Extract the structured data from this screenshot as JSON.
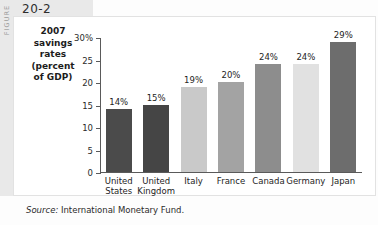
{
  "figure": {
    "label": "FIGURE",
    "number": "20-2"
  },
  "chart_data": {
    "type": "bar",
    "title": "",
    "ylabel": "2007 savings rates (percent of GDP)",
    "ylabel_lines": [
      "2007",
      "savings",
      "rates",
      "(percent",
      "of GDP)"
    ],
    "xlabel": "",
    "categories": [
      "United States",
      "United Kingdom",
      "Italy",
      "France",
      "Canada",
      "Germany",
      "Japan"
    ],
    "category_lines": [
      [
        "United",
        "States"
      ],
      [
        "United",
        "Kingdom"
      ],
      [
        "Italy"
      ],
      [
        "France"
      ],
      [
        "Canada"
      ],
      [
        "Germany"
      ],
      [
        "Japan"
      ]
    ],
    "values": [
      14,
      15,
      19,
      20,
      24,
      24,
      29
    ],
    "value_labels": [
      "14%",
      "15%",
      "19%",
      "20%",
      "24%",
      "24%",
      "29%"
    ],
    "bar_colors": [
      "#4b4b4b",
      "#454545",
      "#c9c9c9",
      "#a3a3a3",
      "#8d8d8d",
      "#e1e1e1",
      "#6d6d6d"
    ],
    "ylim": [
      0,
      30
    ],
    "ytick_values": [
      0,
      5,
      10,
      15,
      20,
      25,
      30
    ],
    "ytick_labels": [
      "0",
      "5",
      "10",
      "15",
      "20",
      "25",
      "30%"
    ],
    "grid": false,
    "legend": false
  },
  "source": {
    "prefix": "Source:",
    "text": "International Monetary Fund."
  }
}
